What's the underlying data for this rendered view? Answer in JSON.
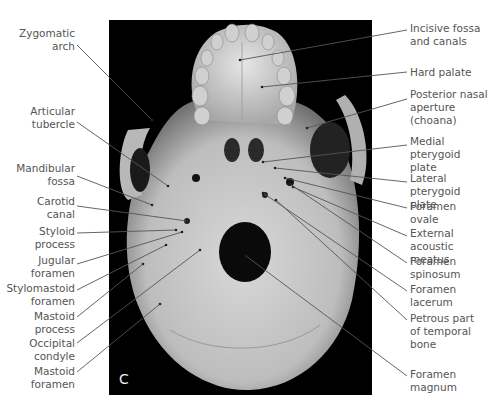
{
  "figure": {
    "panel_letter": "C",
    "view": "Inferior view of skull (norma basalis)"
  },
  "labels_left": [
    {
      "id": "zygomatic-arch",
      "text": "Zygomatic\narch",
      "x": 11,
      "y": 27,
      "w": 64,
      "target": [
        152,
        120
      ],
      "anchor": [
        77,
        45
      ]
    },
    {
      "id": "articular-tubercle",
      "text": "Articular\ntubercle",
      "x": 11,
      "y": 105,
      "w": 64,
      "target": [
        168,
        186
      ],
      "anchor": [
        77,
        122
      ]
    },
    {
      "id": "mandibular-fossa",
      "text": "Mandibular\nfossa",
      "x": 11,
      "y": 162,
      "w": 64,
      "target": [
        152,
        205
      ],
      "anchor": [
        77,
        176
      ]
    },
    {
      "id": "carotid-canal",
      "text": "Carotid\ncanal",
      "x": 11,
      "y": 195,
      "w": 64,
      "target": [
        187,
        221
      ],
      "anchor": [
        77,
        206
      ]
    },
    {
      "id": "styloid-process",
      "text": "Styloid\nprocess",
      "x": 11,
      "y": 225,
      "w": 64,
      "target": [
        176,
        230
      ],
      "anchor": [
        77,
        233
      ]
    },
    {
      "id": "jugular-foramen",
      "text": "Jugular\nforamen",
      "x": 11,
      "y": 254,
      "w": 64,
      "target": [
        182,
        232
      ],
      "anchor": [
        77,
        264
      ]
    },
    {
      "id": "stylomastoid-foramen",
      "text": "Stylomastoid\nforamen",
      "x": 0,
      "y": 282,
      "w": 75,
      "target": [
        166,
        245
      ],
      "anchor": [
        77,
        290
      ]
    },
    {
      "id": "mastoid-process",
      "text": "Mastoid\nprocess",
      "x": 11,
      "y": 310,
      "w": 64,
      "target": [
        143,
        264
      ],
      "anchor": [
        77,
        317
      ]
    },
    {
      "id": "occipital-condyle",
      "text": "Occipital\ncondyle",
      "x": 11,
      "y": 337,
      "w": 64,
      "target": [
        200,
        250
      ],
      "anchor": [
        77,
        343
      ]
    },
    {
      "id": "mastoid-foramen",
      "text": "Mastoid\nforamen",
      "x": 11,
      "y": 365,
      "w": 64,
      "target": [
        160,
        304
      ],
      "anchor": [
        77,
        372
      ]
    }
  ],
  "labels_right": [
    {
      "id": "incisive-fossa",
      "text": "Incisive fossa\nand canals",
      "x": 410,
      "y": 22,
      "w": 82,
      "target": [
        240,
        60
      ],
      "anchor": [
        407,
        30
      ]
    },
    {
      "id": "hard-palate",
      "text": "Hard palate",
      "x": 410,
      "y": 66,
      "w": 82,
      "target": [
        262,
        87
      ],
      "anchor": [
        407,
        72
      ]
    },
    {
      "id": "posterior-nasal-aperture",
      "text": "Posterior nasal\naperture (choana)",
      "x": 410,
      "y": 88,
      "w": 82,
      "target": [
        307,
        128
      ],
      "anchor": [
        407,
        99
      ]
    },
    {
      "id": "medial-pterygoid-plate",
      "text": "Medial pterygoid\nplate",
      "x": 410,
      "y": 135,
      "w": 82,
      "target": [
        263,
        162
      ],
      "anchor": [
        407,
        145
      ]
    },
    {
      "id": "lateral-pterygoid-plate",
      "text": "Lateral pterygoid\nplate",
      "x": 410,
      "y": 172,
      "w": 82,
      "target": [
        275,
        168
      ],
      "anchor": [
        407,
        182
      ]
    },
    {
      "id": "foramen-ovale",
      "text": "Foramen\novale",
      "x": 410,
      "y": 200,
      "w": 82,
      "target": [
        285,
        178
      ],
      "anchor": [
        407,
        208
      ]
    },
    {
      "id": "external-acoustic-meatus",
      "text": "External acoustic\nmeatus",
      "x": 410,
      "y": 227,
      "w": 82,
      "target": [
        293,
        187
      ],
      "anchor": [
        407,
        236
      ]
    },
    {
      "id": "foramen-spinosum",
      "text": "Foramen\nspinosum",
      "x": 410,
      "y": 255,
      "w": 82,
      "target": [
        290,
        184
      ],
      "anchor": [
        407,
        263
      ]
    },
    {
      "id": "foramen-lacerum",
      "text": "Foramen\nlacerum",
      "x": 410,
      "y": 283,
      "w": 82,
      "target": [
        263,
        193
      ],
      "anchor": [
        407,
        291
      ]
    },
    {
      "id": "petrous-part-temporal",
      "text": "Petrous part\nof temporal\nbone",
      "x": 410,
      "y": 312,
      "w": 82,
      "target": [
        276,
        200
      ],
      "anchor": [
        407,
        320
      ]
    },
    {
      "id": "foramen-magnum",
      "text": "Foramen\nmagnum",
      "x": 410,
      "y": 368,
      "w": 82,
      "target": [
        246,
        256
      ],
      "anchor": [
        407,
        376
      ]
    }
  ]
}
